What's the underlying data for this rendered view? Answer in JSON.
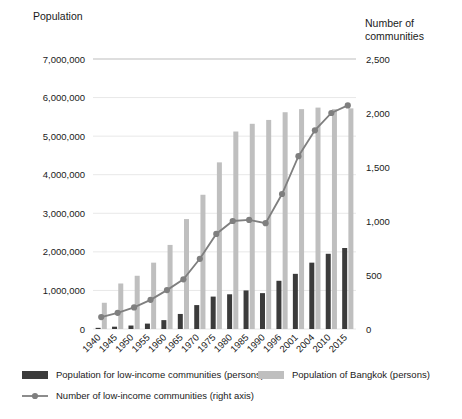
{
  "chart_data": {
    "type": "bar",
    "title": "",
    "subtitle": "",
    "xlabel": "",
    "ylabel": "Population",
    "y2label": "Number of communities",
    "grid": true,
    "legend_position": "bottom",
    "ylim": [
      0,
      7000000
    ],
    "y2lim": [
      0,
      2500
    ],
    "yticks": [
      "0",
      "1,000,000",
      "2,000,000",
      "3,000,000",
      "4,000,000",
      "5,000,000",
      "6,000,000",
      "7,000,000"
    ],
    "ytick_values": [
      0,
      1000000,
      2000000,
      3000000,
      4000000,
      5000000,
      6000000,
      7000000
    ],
    "y2ticks": [
      "0",
      "500",
      "1,000",
      "1,500",
      "2,000",
      "2,500"
    ],
    "y2tick_values": [
      0,
      500,
      1000,
      1500,
      2000,
      2500
    ],
    "categories": [
      "1940",
      "1945",
      "1950",
      "1955",
      "1960",
      "1965",
      "1970",
      "1975",
      "1980",
      "1985",
      "1990",
      "1996",
      "2001",
      "2004",
      "2010",
      "2015"
    ],
    "series": [
      {
        "name": "Population for low-income communities (persons)",
        "axis": "left",
        "type": "bar",
        "color": "#3b3b3b",
        "values": [
          30000,
          60000,
          90000,
          140000,
          230000,
          390000,
          620000,
          840000,
          900000,
          1000000,
          930000,
          1250000,
          1430000,
          1720000,
          1950000,
          2100000
        ]
      },
      {
        "name": "Population of Bangkok (persons)",
        "axis": "left",
        "type": "bar",
        "color": "#bfbfbf",
        "values": [
          680000,
          1180000,
          1380000,
          1720000,
          2180000,
          2850000,
          3480000,
          4320000,
          5120000,
          5320000,
          5420000,
          5620000,
          5700000,
          5740000,
          5700000,
          5720000
        ]
      },
      {
        "name": "Number of low-income communities  (right axis)",
        "axis": "right",
        "type": "line",
        "color": "#7f7f7f",
        "values": [
          110,
          150,
          200,
          270,
          360,
          460,
          650,
          880,
          1000,
          1010,
          980,
          1250,
          1600,
          1840,
          2000,
          2070
        ]
      }
    ],
    "legend": [
      {
        "label": "Population for low-income communities (persons)",
        "marker": "square",
        "color": "#3b3b3b"
      },
      {
        "label": "Population of Bangkok (persons)",
        "marker": "square",
        "color": "#bfbfbf"
      },
      {
        "label": "Number of low-income communities  (right axis)",
        "marker": "line-dot",
        "color": "#7f7f7f"
      }
    ]
  }
}
